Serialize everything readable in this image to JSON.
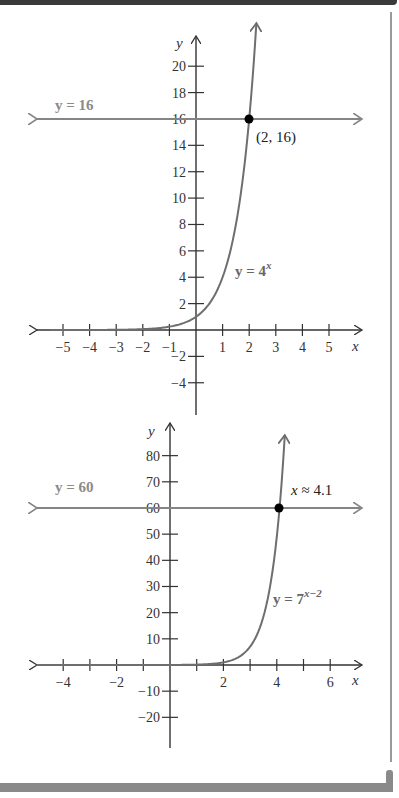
{
  "colors": {
    "axis": "#333333",
    "curve": "#6e6e6e",
    "hline": "#858585",
    "point": "#000000",
    "frame_top": "#3a3a3a",
    "frame_side": "#9a9a9a",
    "frame_bottom": "#8a8a8a"
  },
  "chart_data": [
    {
      "type": "line",
      "title": "",
      "xlabel": "x",
      "ylabel": "y",
      "xlim": [
        -5.5,
        6.3
      ],
      "ylim": [
        -6.5,
        21.5
      ],
      "x_ticks": [
        -5,
        -4,
        -3,
        -2,
        -1,
        1,
        2,
        3,
        4,
        5
      ],
      "x_tick_labels": [
        "−5",
        "−4",
        "−3",
        "−2",
        "−1",
        "1",
        "2",
        "3",
        "4",
        "5"
      ],
      "y_ticks": [
        -4,
        -2,
        2,
        4,
        6,
        8,
        10,
        12,
        14,
        16,
        18,
        20
      ],
      "y_tick_labels": [
        "−4",
        "−2",
        "2",
        "4",
        "6",
        "8",
        "10",
        "12",
        "14",
        "16",
        "18",
        "20"
      ],
      "grid": false,
      "series": [
        {
          "name": "y = 4^x",
          "label": "y = 4",
          "label_sup": "x",
          "function": "4^x",
          "x_range": [
            -5.5,
            2.2
          ]
        },
        {
          "name": "y = 16",
          "label": "y = 16",
          "function": "16",
          "x_range": [
            -5.5,
            5.9
          ]
        }
      ],
      "annotations": [
        {
          "point": [
            2,
            16
          ],
          "label": "(2, 16)"
        }
      ]
    },
    {
      "type": "line",
      "title": "",
      "xlabel": "x",
      "ylabel": "y",
      "xlim": [
        -5,
        7.2
      ],
      "ylim": [
        -32,
        92
      ],
      "x_ticks": [
        -4,
        -3,
        -2,
        -1,
        1,
        2,
        3,
        4,
        5,
        6
      ],
      "x_tick_labels": [
        "−4",
        "",
        "−2",
        "",
        "",
        "2",
        "",
        "4",
        "",
        "6"
      ],
      "y_ticks": [
        -20,
        -10,
        10,
        20,
        30,
        40,
        50,
        60,
        70,
        80
      ],
      "y_tick_labels": [
        "−20",
        "−10",
        "10",
        "20",
        "30",
        "40",
        "50",
        "60",
        "70",
        "80"
      ],
      "grid": false,
      "series": [
        {
          "name": "y = 7^(x-2)",
          "label": "y = 7",
          "label_sup": "x−2",
          "function": "7^(x-2)",
          "x_range": [
            -5,
            4.33
          ]
        },
        {
          "name": "y = 60",
          "label": "y = 60",
          "function": "60",
          "x_range": [
            -5,
            7.2
          ]
        }
      ],
      "annotations": [
        {
          "point": [
            4.1,
            60
          ],
          "label": "x ≈ 4.1"
        }
      ]
    }
  ]
}
